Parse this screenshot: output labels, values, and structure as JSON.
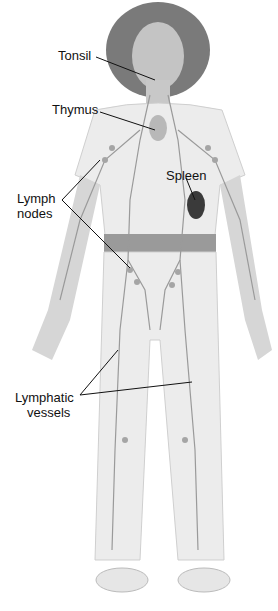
{
  "labels": {
    "tonsil": "Tonsil",
    "thymus": "Thymus",
    "spleen": "Spleen",
    "lymph_nodes_1": "Lymph",
    "lymph_nodes_2": "nodes",
    "lymphatic_vessels_1": "Lymphatic",
    "lymphatic_vessels_2": "vessels"
  },
  "colors": {
    "body": "#d9d9d9",
    "clothes": "#ececec",
    "hair": "#7a7a7a",
    "vessel": "#9a9a9a",
    "spleen": "#3a3a3a",
    "leader": "#111111"
  }
}
